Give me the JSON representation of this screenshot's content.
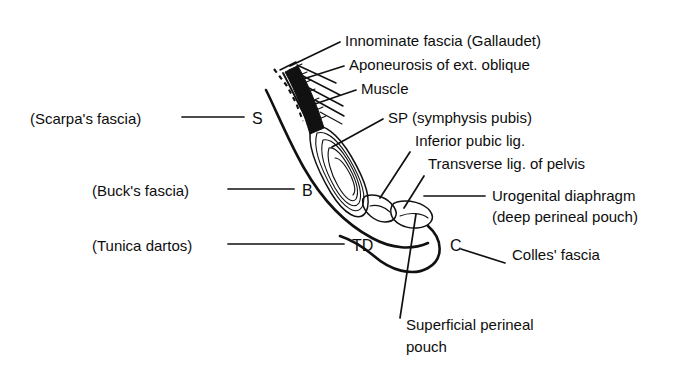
{
  "figure": {
    "background_color": "#ffffff",
    "ink_color": "#111111"
  },
  "labels_right": [
    {
      "id": "innominate-fascia",
      "text": "Innominate fascia (Gallaudet)",
      "x": 345,
      "y": 46
    },
    {
      "id": "aponeurosis-ext-oblique",
      "text": "Aponeurosis of ext. oblique",
      "x": 349,
      "y": 70
    },
    {
      "id": "muscle",
      "text": "Muscle",
      "x": 361,
      "y": 94
    },
    {
      "id": "symphysis-pubis",
      "text": "SP (symphysis pubis)",
      "x": 388,
      "y": 123
    },
    {
      "id": "inferior-pubic-lig",
      "text": "Inferior pubic lig.",
      "x": 415,
      "y": 146
    },
    {
      "id": "transverse-lig-pelvis",
      "text": "Transverse lig. of pelvis",
      "x": 428,
      "y": 169
    },
    {
      "id": "urogenital-diaphragm",
      "text": "Urogenital diaphragm",
      "x": 492,
      "y": 201
    },
    {
      "id": "deep-perineal-pouch",
      "text": "(deep perineal pouch)",
      "x": 492,
      "y": 222
    },
    {
      "id": "colles-fascia",
      "text": "Colles' fascia",
      "x": 512,
      "y": 260
    }
  ],
  "labels_left": [
    {
      "id": "scarpas-fascia",
      "text": "(Scarpa's fascia)",
      "x": 30,
      "y": 124,
      "marker": "S",
      "marker_x": 252,
      "marker_y": 124,
      "line_x1": 182,
      "line_x2": 244,
      "line_y": 117
    },
    {
      "id": "bucks-fascia",
      "text": "(Buck's fascia)",
      "x": 92,
      "y": 196,
      "marker": "B",
      "marker_x": 302,
      "marker_y": 196,
      "line_x1": 228,
      "line_x2": 294,
      "line_y": 189
    },
    {
      "id": "tunica-dartos",
      "text": "(Tunica dartos)",
      "x": 92,
      "y": 251,
      "marker": "TD",
      "marker_x": 352,
      "marker_y": 251,
      "line_x1": 228,
      "line_x2": 344,
      "line_y": 244
    }
  ],
  "labels_bottom": [
    {
      "id": "superficial-perineal-pouch-line1",
      "text": "Superficial perineal",
      "x": 406,
      "y": 330
    },
    {
      "id": "superficial-perineal-pouch-line2",
      "text": "pouch",
      "x": 406,
      "y": 352
    }
  ],
  "markers_inline": [
    {
      "id": "colles-marker",
      "text": "C",
      "x": 450,
      "y": 251
    }
  ]
}
